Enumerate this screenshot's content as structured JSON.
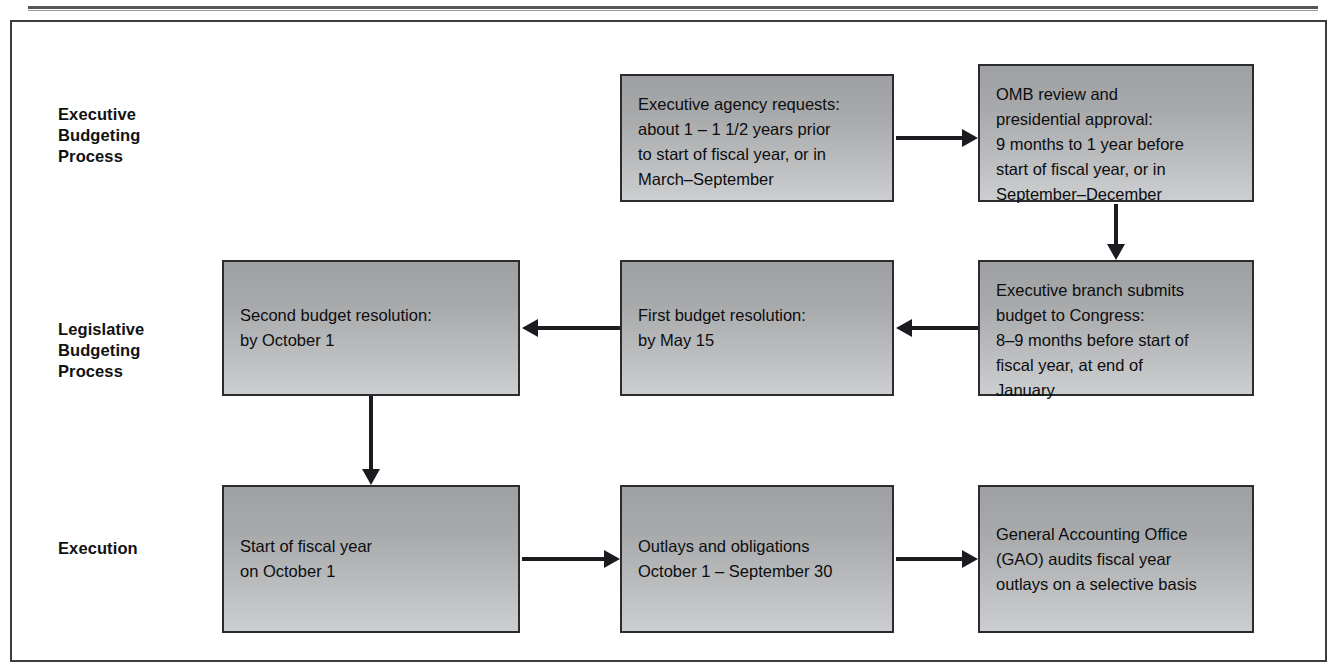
{
  "page": {
    "running_head": ""
  },
  "figure": {
    "row_labels": [
      {
        "id": "executive",
        "text": "Executive\nBudgeting\nProcess"
      },
      {
        "id": "legislative",
        "text": "Legislative\nBudgeting\nProcess"
      },
      {
        "id": "execution",
        "text": "Execution"
      }
    ],
    "nodes": [
      {
        "id": "agency-requests",
        "text": "Executive agency requests:\nabout 1 – 1 1/2 years prior\nto start of fiscal year, or in\nMarch–September"
      },
      {
        "id": "omb-review",
        "text": "OMB review and\npresidential approval:\n9 months to 1 year before\nstart of fiscal year, or in\nSeptember–December"
      },
      {
        "id": "second-budget-resolution",
        "text": "Second budget resolution:\nby October 1"
      },
      {
        "id": "first-budget-resolution",
        "text": "First budget resolution:\nby May 15"
      },
      {
        "id": "executive-branch-submits",
        "text": "Executive branch submits\nbudget to Congress:\n8–9 months before start of\nfiscal year, at end of\nJanuary"
      },
      {
        "id": "start-of-fiscal-year",
        "text": "Start of fiscal year\non October 1"
      },
      {
        "id": "outlays-and-obligations",
        "text": "Outlays and obligations\nOctober 1 – September 30"
      },
      {
        "id": "gao-audits",
        "text": "General Accounting Office\n(GAO) audits fiscal year\noutlays on a selective basis"
      }
    ],
    "colors": {
      "node_fill_top": "#9fa0a2",
      "node_fill_bottom": "#cdcecf",
      "node_border": "#2b2c30",
      "arrow": "#1b1c1f",
      "frame": "#3c3d41",
      "text": "#0c0d0f",
      "page_background": "#ffffff"
    }
  }
}
